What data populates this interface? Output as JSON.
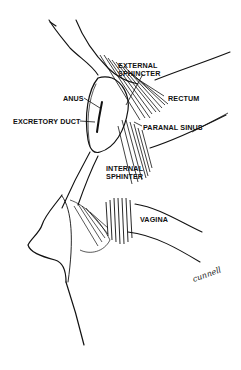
{
  "figure": {
    "type": "anatomical-illustration",
    "labels": {
      "external_sphincter_l1": "EXTERNAL",
      "external_sphincter_l2": "SPHINCTER",
      "rectum": "RECTUM",
      "anus": "ANUS",
      "excretory_duct": "EXCRETORY DUCT",
      "paranal_sinus": "PARANAL SINUS",
      "internal_sphincter_l1": "INTERNAL",
      "internal_sphincter_l2": "SPHINTER",
      "vagina": "VAGINA"
    },
    "signature": "cunnell",
    "colors": {
      "ink": "#111111",
      "background": "#ffffff"
    }
  }
}
